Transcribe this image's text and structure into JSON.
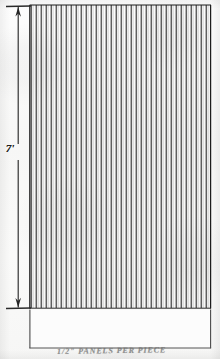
{
  "sheet": {
    "width": 220,
    "height": 359,
    "paper_color": "#fbfbfb",
    "ink_color": "#1d1d1d",
    "title": "Hatched Panel Elevation Drawing"
  },
  "dimension": {
    "label": "7'",
    "name": "overall-height",
    "orientation": "vertical",
    "line_x": 18,
    "arrow_top_y": 7,
    "arrow_bottom_y": 307,
    "tick_left_x": 6,
    "tick_right_x": 31
  },
  "main_panel": {
    "name": "hatched-panel",
    "x": 30,
    "y": 5,
    "width": 181,
    "height": 303,
    "fill": "none",
    "stroke": "#1d1d1d",
    "hatch": {
      "type": "vertical-lines",
      "count": 36,
      "spacing_px": 5.0,
      "stroke_width": 1.0,
      "stroke": "#222222"
    }
  },
  "lower_panel": {
    "name": "lower-blank-panel",
    "x": 30,
    "y": 309,
    "width": 181,
    "height": 39,
    "fill": "none",
    "stroke": "#4a4a4a"
  },
  "caption": {
    "name": "handwritten-caption",
    "text": "1/2\" PANELS PER PIECE",
    "legible": false,
    "note": "faint cursive annotation, clipped by sheet bottom edge"
  }
}
